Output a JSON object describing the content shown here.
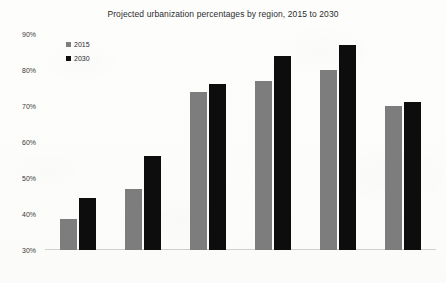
{
  "chart_data": {
    "type": "bar",
    "title": "Projected urbanization percentages by region, 2015 to 2030",
    "xlabel": "",
    "ylabel": "",
    "categories": [
      "Africa",
      "Asia",
      "Europe",
      "North America",
      "Latin America",
      "Oceania"
    ],
    "series": [
      {
        "name": "2015",
        "color": "#7d7d7d",
        "values": [
          38.5,
          47,
          74,
          77,
          80,
          70
        ]
      },
      {
        "name": "2030",
        "color": "#0d0d0d",
        "values": [
          44.5,
          56,
          76,
          84,
          87,
          71
        ]
      }
    ],
    "ylim": [
      30,
      90
    ],
    "ytick_step": 10,
    "ytick_labels": [
      "90%",
      "80%",
      "70%",
      "60%",
      "50%",
      "40%",
      "30%"
    ],
    "ytick_values": [
      90,
      80,
      70,
      60,
      50,
      40,
      30
    ],
    "grid": false,
    "legend_position": "top-left-inside"
  }
}
